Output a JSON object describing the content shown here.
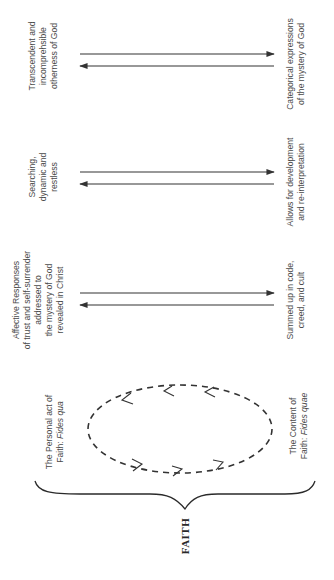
{
  "diagram": {
    "title": "FAITH",
    "orientation": "rotated-90-ccw",
    "colors": {
      "line": "#333333",
      "text": "#4a4a4a",
      "background": "#ffffff"
    },
    "left_column": {
      "personal_act": {
        "line1": "The Personal act of",
        "line2_prefix": "Faith: ",
        "line2_italic": "Fides qua"
      },
      "rows": [
        {
          "lines": [
            "Affective Responses",
            "of trust and self-surrender",
            "addressed to",
            "the mystery of God",
            "revealed in Christ"
          ]
        },
        {
          "lines": [
            "Searching,",
            "dynamic and",
            "restless"
          ]
        },
        {
          "lines": [
            "Transcendent and",
            "incomprehsible",
            "otherness of God"
          ]
        }
      ]
    },
    "right_column": {
      "content": {
        "line1": "The Content of",
        "line2_prefix": "Faith: ",
        "line2_italic": "Fides quae"
      },
      "rows": [
        {
          "lines": [
            "Summed up in code,",
            "creed, and cult"
          ]
        },
        {
          "lines": [
            "Allows for development",
            "and re-interpretation"
          ]
        },
        {
          "lines": [
            "Categorical expressions",
            "of the mystery of God"
          ]
        }
      ]
    },
    "arrows": [
      {
        "name": "arrow-pair-affective-summed",
        "y_top": 293,
        "y_bottom": 305
      },
      {
        "name": "arrow-pair-searching-development",
        "y_top": 172,
        "y_bottom": 184
      },
      {
        "name": "arrow-pair-transcendent-categorical",
        "y_top": 54,
        "y_bottom": 66
      }
    ],
    "cycle": {
      "description": "dashed ellipse with direction chevrons"
    }
  }
}
